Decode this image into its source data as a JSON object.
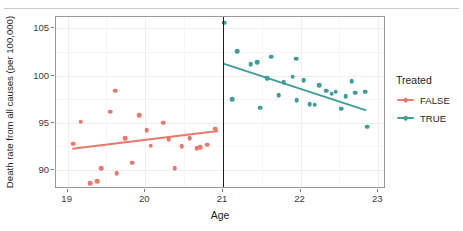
{
  "chart_data": {
    "type": "scatter",
    "title": "",
    "xlabel": "Age",
    "ylabel": "Death rate from all causes (per 100,000)",
    "xlim": [
      18.85,
      23.1
    ],
    "ylim": [
      88.0,
      106.2
    ],
    "xticks": [
      19,
      20,
      21,
      22,
      23
    ],
    "yticks": [
      90,
      95,
      100,
      105
    ],
    "xtick_labels": [
      "19",
      "20",
      "21",
      "22",
      "23"
    ],
    "ytick_labels": [
      "90",
      "95",
      "100",
      "105"
    ],
    "grid": true,
    "legend": {
      "title": "Treated",
      "position": "right",
      "entries": [
        {
          "label": "FALSE",
          "color": "#E8796A"
        },
        {
          "label": "TRUE",
          "color": "#3F9D9A"
        }
      ]
    },
    "annotations": [
      {
        "type": "vline",
        "x": 21,
        "color": "#1c1c1c",
        "label": "cutoff at age 21"
      }
    ],
    "series": [
      {
        "name": "FALSE",
        "color": "#E8796A",
        "points": [
          [
            19.07,
            92.8
          ],
          [
            19.17,
            95.1
          ],
          [
            19.29,
            88.6
          ],
          [
            19.38,
            88.8
          ],
          [
            19.43,
            90.2
          ],
          [
            19.55,
            96.2
          ],
          [
            19.63,
            89.7
          ],
          [
            19.74,
            93.4
          ],
          [
            19.83,
            90.8
          ],
          [
            19.92,
            95.8
          ],
          [
            20.02,
            94.2
          ],
          [
            20.07,
            92.6
          ],
          [
            20.23,
            95.0
          ],
          [
            20.3,
            93.3
          ],
          [
            20.38,
            90.2
          ],
          [
            20.47,
            92.5
          ],
          [
            20.57,
            93.4
          ],
          [
            20.66,
            92.3
          ],
          [
            20.71,
            92.4
          ],
          [
            20.8,
            92.7
          ],
          [
            20.9,
            94.4
          ],
          [
            19.61,
            98.4
          ]
        ],
        "fit": {
          "x0": 19.05,
          "y0": 92.1,
          "x1": 20.95,
          "y1": 94.0
        }
      },
      {
        "name": "TRUE",
        "color": "#3F9D9A",
        "points": [
          [
            21.02,
            105.6
          ],
          [
            21.18,
            102.6
          ],
          [
            21.36,
            101.2
          ],
          [
            21.44,
            101.4
          ],
          [
            21.57,
            99.7
          ],
          [
            21.62,
            102.0
          ],
          [
            21.72,
            97.9
          ],
          [
            21.78,
            99.3
          ],
          [
            21.12,
            97.5
          ],
          [
            21.48,
            96.6
          ],
          [
            21.94,
            101.8
          ],
          [
            21.9,
            99.9
          ],
          [
            21.95,
            97.4
          ],
          [
            22.04,
            99.5
          ],
          [
            22.12,
            97.0
          ],
          [
            22.18,
            96.9
          ],
          [
            22.24,
            99.0
          ],
          [
            22.33,
            98.4
          ],
          [
            22.4,
            98.1
          ],
          [
            22.45,
            98.3
          ],
          [
            22.52,
            96.5
          ],
          [
            22.58,
            97.8
          ],
          [
            22.66,
            99.4
          ],
          [
            22.7,
            98.2
          ],
          [
            22.83,
            98.3
          ],
          [
            22.86,
            94.6
          ]
        ],
        "fit": {
          "x0": 21.02,
          "y0": 101.2,
          "x1": 22.88,
          "y1": 96.2
        }
      }
    ]
  }
}
